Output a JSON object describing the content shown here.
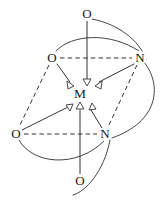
{
  "figure": {
    "background_color": "#ffffff",
    "line_color": "#333333",
    "curve_color": "#444444",
    "arrowhead_fill": "#ffffff",
    "width": 166,
    "height": 209
  },
  "atoms": [
    {
      "id": "o-top",
      "label": "O",
      "element": "oxygen",
      "role": "donor",
      "x": 87,
      "y": 14
    },
    {
      "id": "o-upper-left",
      "label": "O",
      "element": "oxygen",
      "role": "donor",
      "x": 52,
      "y": 58
    },
    {
      "id": "n-upper-right",
      "label": "N",
      "element": "nitrogen",
      "role": "donor",
      "x": 140,
      "y": 58
    },
    {
      "id": "m-center",
      "label": "M",
      "element": "metal",
      "role": "center",
      "x": 80,
      "y": 94
    },
    {
      "id": "o-lower-left",
      "label": "O",
      "element": "oxygen",
      "role": "donor",
      "x": 16,
      "y": 134
    },
    {
      "id": "n-lower-right",
      "label": "N",
      "element": "nitrogen",
      "role": "donor",
      "x": 105,
      "y": 134
    },
    {
      "id": "o-bottom",
      "label": "O",
      "element": "oxygen",
      "role": "donor",
      "x": 80,
      "y": 181
    }
  ],
  "dative_bonds": [
    {
      "id": "bond-o-top-to-m",
      "from": "o-top",
      "to": "m-center",
      "style": "solid-arrow"
    },
    {
      "id": "bond-o-upper-left-to-m",
      "from": "o-upper-left",
      "to": "m-center",
      "style": "solid-arrow"
    },
    {
      "id": "bond-n-upper-right-to-m",
      "from": "n-upper-right",
      "to": "m-center",
      "style": "solid-arrow"
    },
    {
      "id": "bond-o-lower-left-to-m",
      "from": "o-lower-left",
      "to": "m-center",
      "style": "solid-arrow"
    },
    {
      "id": "bond-n-lower-right-to-m",
      "from": "n-lower-right",
      "to": "m-center",
      "style": "solid-arrow"
    },
    {
      "id": "bond-o-bottom-to-m",
      "from": "o-bottom",
      "to": "m-center",
      "style": "solid-arrow"
    }
  ],
  "octahedron_edges": [
    {
      "id": "edge-oul-nur",
      "from": "o-upper-left",
      "to": "n-upper-right",
      "style": "dashed"
    },
    {
      "id": "edge-oll-nlr",
      "from": "o-lower-left",
      "to": "n-lower-right",
      "style": "dashed"
    },
    {
      "id": "edge-oul-oll",
      "from": "o-upper-left",
      "to": "o-lower-left",
      "style": "dashed"
    },
    {
      "id": "edge-nur-nlr",
      "from": "n-upper-right",
      "to": "n-lower-right",
      "style": "dashed"
    }
  ],
  "chelate_arcs": [
    {
      "id": "arc-otop-nur",
      "from": "o-top",
      "to": "n-upper-right",
      "bulge": "right"
    },
    {
      "id": "arc-oul-nur",
      "from": "o-upper-left",
      "to": "n-upper-right",
      "bulge": "up"
    },
    {
      "id": "arc-nur-nlr",
      "from": "n-upper-right",
      "to": "n-lower-right",
      "bulge": "right"
    },
    {
      "id": "arc-oll-nlr",
      "from": "o-lower-left",
      "to": "n-lower-right",
      "bulge": "down"
    },
    {
      "id": "arc-obottom-nlr",
      "from": "o-bottom",
      "to": "n-lower-right",
      "bulge": "right"
    }
  ]
}
